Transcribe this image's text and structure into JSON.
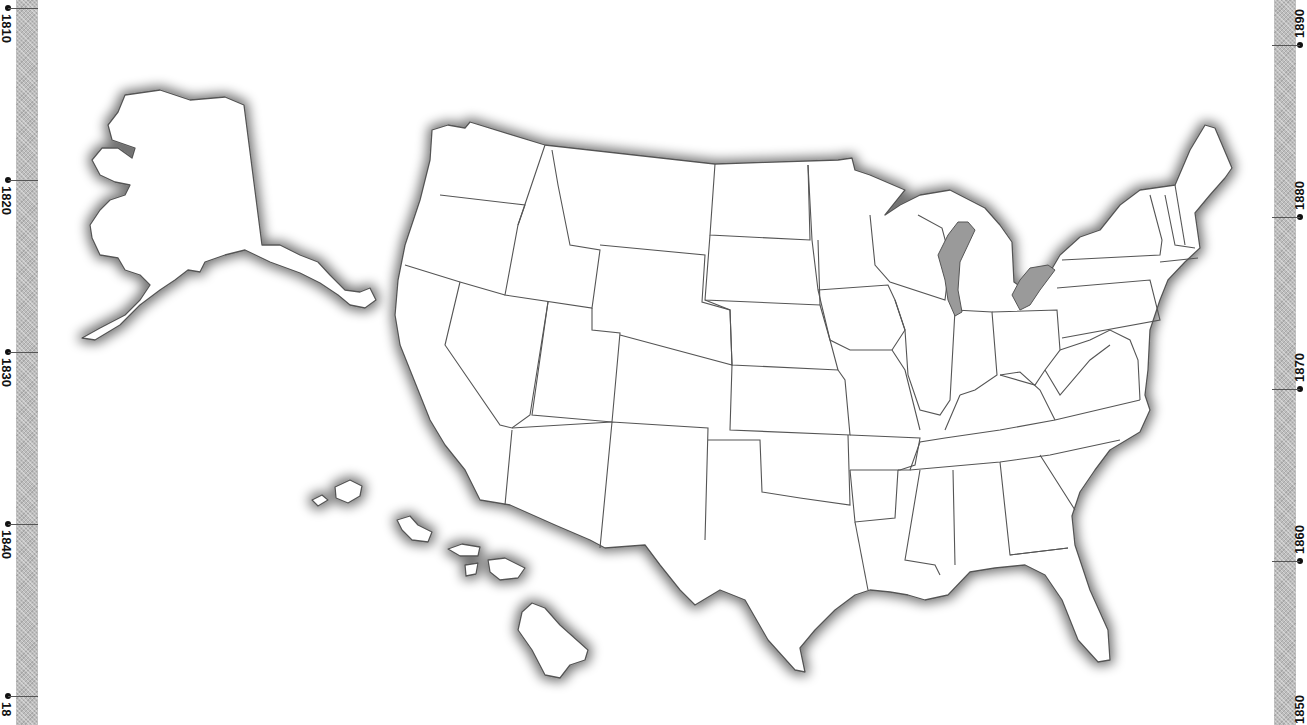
{
  "map": {
    "title": "United States outline map",
    "regions": [
      "Alaska",
      "Hawaii",
      "Contiguous United States"
    ],
    "colors": {
      "land": "#ffffff",
      "border": "#555555",
      "coast_shadow": "#8a8a8a",
      "strip": "#bdbdbd"
    }
  },
  "timeline_left": {
    "ticks": [
      {
        "label": "1810",
        "y": 8
      },
      {
        "label": "1820",
        "y": 180
      },
      {
        "label": "1830",
        "y": 352
      },
      {
        "label": "1840",
        "y": 524
      },
      {
        "label": "18",
        "y": 696
      }
    ]
  },
  "timeline_right": {
    "ticks": [
      {
        "label": "1890",
        "y": 45
      },
      {
        "label": "1880",
        "y": 217
      },
      {
        "label": "1870",
        "y": 389
      },
      {
        "label": "1860",
        "y": 561
      },
      {
        "label": "1850",
        "y": 733
      }
    ]
  }
}
